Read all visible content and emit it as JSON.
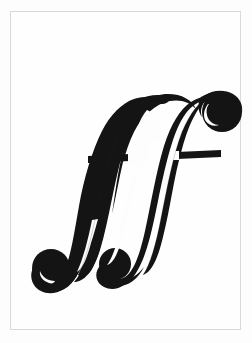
{
  "image": {
    "kind": "scanned-music-notation-glyph",
    "subject": "ff",
    "subject_name": "fortissimo-dynamic-marking",
    "description": "Bold italic ff ligature, music dynamic marking, black ink on white paper",
    "width": 252,
    "height": 343
  },
  "colors": {
    "page_background": "#ffffff",
    "paper": "#fdfdfd",
    "frame_border": "#d9d9d9",
    "ink": "#141414",
    "ink_soft": "#1d1d1d"
  },
  "frame": {
    "name": "photo-border",
    "left": 10,
    "top": 11,
    "width": 231,
    "height": 319,
    "stroke_width": 1
  },
  "glyph": {
    "label": "ff",
    "semantic": "fortissimo",
    "bounds": {
      "left": 30,
      "top": 86,
      "right": 222,
      "bottom": 273
    },
    "parts": [
      {
        "name": "first-f-stem",
        "label": "f"
      },
      {
        "name": "second-f-stem",
        "label": "f"
      },
      {
        "name": "top-left-arc-terminal",
        "label": "arc"
      },
      {
        "name": "top-right-ball-terminal",
        "label": "ball"
      },
      {
        "name": "bottom-left-ball-terminal",
        "label": "ball"
      },
      {
        "name": "bottom-middle-ball-terminal",
        "label": "ball"
      },
      {
        "name": "crossbar-left",
        "label": "crossbar"
      },
      {
        "name": "crossbar-right",
        "label": "crossbar"
      }
    ]
  }
}
